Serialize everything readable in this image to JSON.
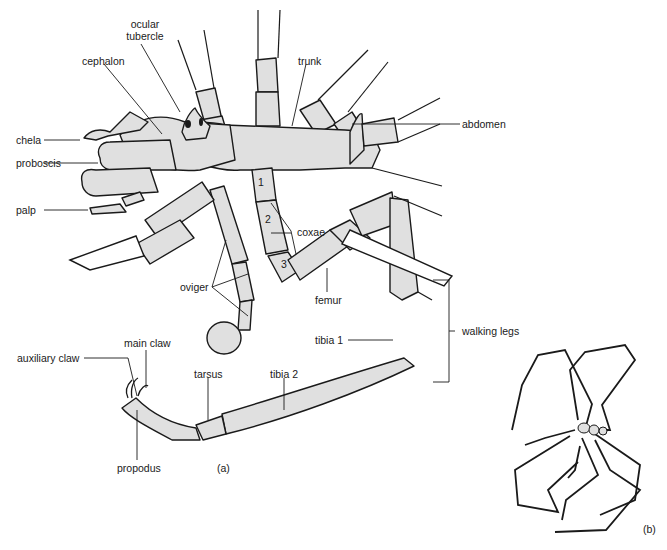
{
  "figure": {
    "panels": [
      {
        "id": "a",
        "label": "(a)",
        "description": "Ventral/dorsal detail view of body and appendages"
      },
      {
        "id": "b",
        "label": "(b)",
        "description": "Whole animal with long walking legs"
      }
    ],
    "colors": {
      "fill": "#e0e0e0",
      "stroke": "#1a1a1a",
      "background": "#ffffff"
    }
  },
  "labels": {
    "ocular_tubercle_1": "ocular",
    "ocular_tubercle_2": "tubercle",
    "cephalon": "cephalon",
    "trunk": "trunk",
    "abdomen": "abdomen",
    "chela": "chela",
    "proboscis": "proboscis",
    "palp": "palp",
    "coxae": "coxae",
    "coxa_1": "1",
    "coxa_2": "2",
    "coxa_3": "3",
    "oviger": "oviger",
    "femur": "femur",
    "walking_legs": "walking legs",
    "tibia_1": "tibia 1",
    "tibia_2": "tibia 2",
    "tarsus": "tarsus",
    "main_claw": "main claw",
    "auxiliary_claw": "auxiliary claw",
    "propodus": "propodus",
    "panel_a": "(a)",
    "panel_b": "(b)"
  }
}
